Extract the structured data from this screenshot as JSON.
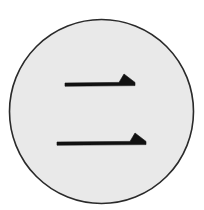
{
  "diagram": {
    "background": "#ffffff",
    "circle": {
      "cx": 101.5,
      "cy": 111.5,
      "r": 92,
      "fill": "#e9e9e9",
      "stroke": "#2a2a2a",
      "stroke_width": 1.6
    },
    "strokes": [
      {
        "name": "upper-half-arrow",
        "x1": 65,
        "x2": 135,
        "y": 84,
        "head_start_x": 119,
        "head_peak_x": 124,
        "head_peak_y": 74,
        "color": "#111111"
      },
      {
        "name": "lower-half-arrow",
        "x1": 57,
        "x2": 146,
        "y": 143,
        "head_start_x": 130,
        "head_peak_x": 135,
        "head_peak_y": 133,
        "color": "#111111"
      }
    ]
  }
}
